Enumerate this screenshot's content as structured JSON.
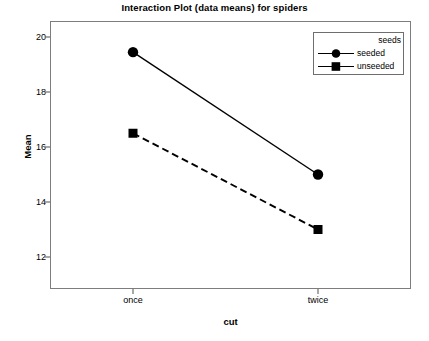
{
  "chart_data": {
    "type": "line",
    "title": "Interaction Plot (data means) for spiders",
    "xlabel": "cut",
    "ylabel": "Mean",
    "categories": [
      "once",
      "twice"
    ],
    "series": [
      {
        "name": "seeded",
        "values": [
          19.45,
          15.0
        ],
        "marker": "circle",
        "linestyle": "solid"
      },
      {
        "name": "unseeded",
        "values": [
          16.5,
          13.0
        ],
        "marker": "square",
        "linestyle": "dashed"
      }
    ],
    "legend": {
      "title": "seeds",
      "position": "top-right",
      "entries": [
        "seeded",
        "unseeded"
      ]
    },
    "yticks": [
      12,
      14,
      16,
      18,
      20
    ],
    "ylim": [
      11.0,
      20.7
    ],
    "grid": false,
    "line_color": "#000000",
    "frame_color": "#7d7d7d"
  },
  "axes": {
    "y_tick_labels": [
      "20",
      "18",
      "16",
      "14",
      "12"
    ],
    "x_tick_labels": [
      "once",
      "twice"
    ],
    "y_title": "Mean",
    "x_title": "cut"
  },
  "legend": {
    "title": "seeds",
    "items": [
      {
        "label": "seeded"
      },
      {
        "label": "unseeded"
      }
    ]
  },
  "title": "Interaction Plot (data means) for spiders"
}
